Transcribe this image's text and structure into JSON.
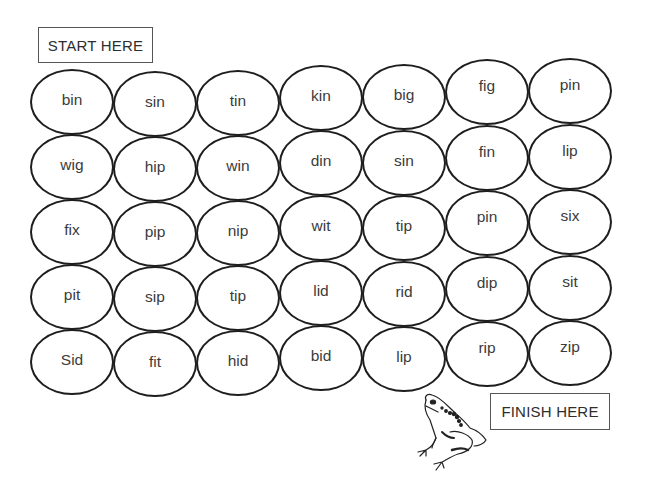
{
  "labels": {
    "start": "START HERE",
    "finish": "FINISH HERE"
  },
  "grid": {
    "columns": [
      [
        "bin",
        "wig",
        "fix",
        "pit",
        "Sid"
      ],
      [
        "sin",
        "hip",
        "pip",
        "sip",
        "fit"
      ],
      [
        "tin",
        "win",
        "nip",
        "tip",
        "hid"
      ],
      [
        "kin",
        "din",
        "wit",
        "lid",
        "bid"
      ],
      [
        "big",
        "sin",
        "tip",
        "rid",
        "lip"
      ],
      [
        "fig",
        "fin",
        "pin",
        "dip",
        "rip"
      ],
      [
        "pin",
        "lip",
        "six",
        "sit",
        "zip"
      ]
    ],
    "rows": [
      [
        "bin",
        "sin",
        "tin",
        "kin",
        "big",
        "fig",
        "pin"
      ],
      [
        "wig",
        "hip",
        "win",
        "din",
        "sin",
        "fin",
        "lip"
      ],
      [
        "fix",
        "pip",
        "nip",
        "wit",
        "tip",
        "pin",
        "six"
      ],
      [
        "pit",
        "sip",
        "tip",
        "lid",
        "rid",
        "dip",
        "sit"
      ],
      [
        "Sid",
        "fit",
        "hid",
        "bid",
        "lip",
        "rip",
        "zip"
      ]
    ]
  },
  "icons": {
    "decoration": "frog-icon"
  },
  "colors": {
    "outline": "#1e1e1e",
    "text": "#3b3b3b",
    "background": "#ffffff"
  }
}
